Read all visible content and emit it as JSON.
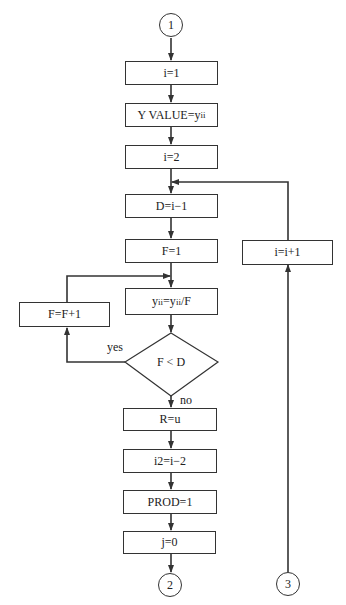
{
  "connectors": {
    "start": "1",
    "end_main": "2",
    "end_loop": "3"
  },
  "steps": {
    "i_init": "i=1",
    "yvalue_prefix": "Y VALUE=y",
    "yvalue_sub": "ii",
    "i_two": "i=2",
    "d_assign": "D=i−1",
    "f_init": "F=1",
    "ydiv_y1": "y",
    "ydiv_sub1": "ii",
    "ydiv_eq": "=y",
    "ydiv_sub2": "ii",
    "ydiv_tail": "/F",
    "f_increment": "F=F+1",
    "decision": "F < D",
    "r_assign": "R=u",
    "i2_assign": "i2=i−2",
    "prod_init": "PROD=1",
    "j_init": "j=0",
    "i_increment": "i=i+1"
  },
  "edge_labels": {
    "yes": "yes",
    "no": "no"
  },
  "colors": {
    "stroke": "#333333",
    "background": "#ffffff"
  }
}
